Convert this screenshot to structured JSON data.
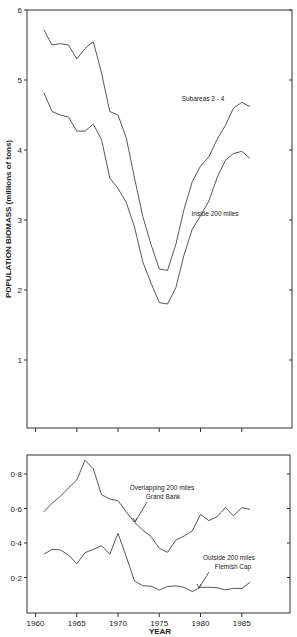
{
  "chart_data": [
    {
      "type": "line",
      "title": "",
      "xlabel": "",
      "ylabel": "POPULATION BIOMASS (millions of tons)",
      "xlim": [
        1959,
        1990
      ],
      "ylim": [
        0,
        6
      ],
      "yticks": [
        1,
        2,
        3,
        4,
        5,
        6
      ],
      "ytick_labels": [
        "1",
        "2",
        "3",
        "4",
        "5",
        "6"
      ],
      "xticks": [
        1960,
        1965,
        1970,
        1975,
        1980,
        1985
      ],
      "grid": false,
      "x": [
        1961,
        1962,
        1963,
        1964,
        1965,
        1966,
        1967,
        1968,
        1969,
        1970,
        1971,
        1972,
        1973,
        1974,
        1975,
        1976,
        1977,
        1978,
        1979,
        1980,
        1981,
        1982,
        1983,
        1984,
        1985,
        1986
      ],
      "series": [
        {
          "name": "Subareas 2 - 4",
          "values": [
            5.72,
            5.5,
            5.52,
            5.5,
            5.3,
            5.45,
            5.55,
            5.1,
            4.55,
            4.5,
            4.17,
            3.6,
            3.05,
            2.65,
            2.3,
            2.28,
            2.65,
            3.15,
            3.55,
            3.77,
            3.9,
            4.15,
            4.35,
            4.6,
            4.68,
            4.62
          ]
        },
        {
          "name": "Inside 200 miles",
          "values": [
            4.82,
            4.55,
            4.5,
            4.47,
            4.27,
            4.27,
            4.37,
            4.15,
            3.6,
            3.45,
            3.25,
            2.9,
            2.4,
            2.1,
            1.82,
            1.8,
            2.03,
            2.5,
            2.87,
            3.06,
            3.27,
            3.6,
            3.85,
            3.95,
            3.98,
            3.88
          ]
        }
      ],
      "annotations": [
        {
          "text": "Subareas 2 - 4",
          "series": "Subareas 2 - 4"
        },
        {
          "text": "Inside 200 miles",
          "series": "Inside 200 miles"
        }
      ]
    },
    {
      "type": "line",
      "title": "",
      "xlabel": "YEAR",
      "ylabel": "",
      "xlim": [
        1959,
        1990
      ],
      "ylim": [
        0,
        0.9
      ],
      "yticks": [
        0.2,
        0.4,
        0.6,
        0.8
      ],
      "ytick_labels": [
        "0·2",
        "0·4",
        "0·6",
        "0·8"
      ],
      "xticks": [
        1960,
        1965,
        1970,
        1975,
        1980,
        1985
      ],
      "xtick_labels": [
        "1960",
        "1965",
        "1970",
        "1975",
        "1980",
        "1985"
      ],
      "grid": false,
      "x": [
        1961,
        1962,
        1963,
        1964,
        1965,
        1966,
        1967,
        1968,
        1969,
        1970,
        1971,
        1972,
        1973,
        1974,
        1975,
        1976,
        1977,
        1978,
        1979,
        1980,
        1981,
        1982,
        1983,
        1984,
        1985,
        1986
      ],
      "series": [
        {
          "name": "Overlapping 200 miles Grand Bank",
          "values": [
            0.58,
            0.63,
            0.67,
            0.72,
            0.765,
            0.88,
            0.83,
            0.68,
            0.655,
            0.645,
            0.58,
            0.52,
            0.475,
            0.437,
            0.37,
            0.346,
            0.417,
            0.44,
            0.47,
            0.566,
            0.53,
            0.552,
            0.605,
            0.558,
            0.605,
            0.595
          ]
        },
        {
          "name": "Outside 200 miles Flemish Cap",
          "values": [
            0.335,
            0.363,
            0.36,
            0.33,
            0.28,
            0.344,
            0.363,
            0.384,
            0.335,
            0.456,
            0.32,
            0.18,
            0.152,
            0.15,
            0.127,
            0.147,
            0.152,
            0.143,
            0.118,
            0.143,
            0.143,
            0.141,
            0.128,
            0.137,
            0.137,
            0.172
          ]
        }
      ],
      "annotations": [
        {
          "text": "Overlapping 200 miles",
          "text2": "Grand Bank",
          "series": "Overlapping 200 miles Grand Bank"
        },
        {
          "text": "Outside 200 miles",
          "text2": "Flemish Cap",
          "series": "Outside 200 miles Flemish Cap"
        }
      ]
    }
  ],
  "layout": {
    "top": {
      "left": 27,
      "right": 292,
      "top": 10,
      "bottom": 428,
      "ymin": 0,
      "ymax": 6,
      "pxPerUnit": 70,
      "y0px": 430
    },
    "bottom": {
      "left": 27,
      "right": 290,
      "top": 455,
      "bottom": 613,
      "ymin": 0,
      "ymax": 0.9,
      "y0px": 612,
      "pxPerUnit": 172.5
    },
    "x": {
      "year0": 1960,
      "px0": 35.5,
      "pxPerYear": 8.25
    }
  },
  "labels": {
    "top_ylabel": "POPULATION BIOMASS (millions of tons)",
    "subareas": "Subareas 2 - 4",
    "inside": "Inside 200 miles",
    "overlapping_1": "Overlapping 200 miles",
    "overlapping_2": "Grand Bank",
    "outside_1": "Outside 200 miles",
    "outside_2": "Flemish Cap",
    "xlabel": "YEAR"
  }
}
